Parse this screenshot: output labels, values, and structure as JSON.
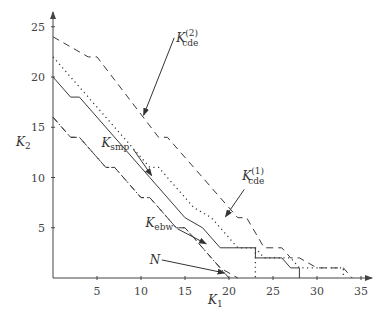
{
  "chart_data": {
    "type": "line",
    "title": "",
    "xlabel": "K1",
    "ylabel": "K2",
    "xlim": [
      0,
      36
    ],
    "ylim": [
      0,
      26
    ],
    "xticks": [
      5,
      10,
      15,
      20,
      25,
      30,
      35
    ],
    "yticks": [
      5,
      10,
      15,
      20,
      25
    ],
    "grid": false,
    "legend": "none (inline annotations with arrows)",
    "series": [
      {
        "name": "K_cde^(2)",
        "style": "dashed",
        "points": [
          [
            0,
            24
          ],
          [
            4,
            22
          ],
          [
            5,
            22
          ],
          [
            12,
            14
          ],
          [
            13,
            14
          ],
          [
            17,
            10
          ],
          [
            18,
            9
          ],
          [
            21,
            6
          ],
          [
            22,
            6
          ],
          [
            24,
            3
          ],
          [
            26,
            3
          ],
          [
            27,
            2
          ],
          [
            28,
            2
          ],
          [
            30,
            1
          ],
          [
            33,
            1
          ],
          [
            34,
            0
          ]
        ]
      },
      {
        "name": "K_cde^(1)",
        "style": "dotted",
        "points": [
          [
            0,
            22
          ],
          [
            9,
            13
          ],
          [
            11,
            11
          ],
          [
            12,
            11
          ],
          [
            16,
            7
          ],
          [
            18,
            6
          ],
          [
            20,
            4
          ],
          [
            21,
            3
          ],
          [
            23,
            3
          ],
          [
            24,
            2
          ],
          [
            27,
            2
          ],
          [
            28,
            1
          ],
          [
            33,
            1
          ],
          [
            33,
            0
          ]
        ]
      },
      {
        "name": "K_smp",
        "style": "solid",
        "points": [
          [
            0,
            20
          ],
          [
            2,
            18
          ],
          [
            3,
            18
          ],
          [
            11,
            10
          ],
          [
            15,
            6
          ],
          [
            17,
            5
          ],
          [
            19,
            3
          ],
          [
            23,
            3
          ],
          [
            23,
            2
          ],
          [
            26,
            2
          ],
          [
            27,
            1
          ],
          [
            28,
            1
          ],
          [
            28,
            0
          ]
        ]
      },
      {
        "name": "K_ebw",
        "style": "dashdot",
        "points": [
          [
            0,
            16
          ],
          [
            2,
            14
          ],
          [
            3,
            14
          ],
          [
            6,
            11
          ],
          [
            7,
            11
          ],
          [
            10,
            8
          ],
          [
            11,
            8
          ],
          [
            14,
            5
          ],
          [
            15,
            5
          ],
          [
            20,
            0
          ]
        ]
      },
      {
        "name": "N",
        "style": "dashed",
        "points": [
          [
            0,
            16
          ],
          [
            2,
            14
          ],
          [
            3,
            14
          ],
          [
            6,
            11
          ],
          [
            7,
            11
          ],
          [
            10,
            8
          ],
          [
            11,
            8
          ],
          [
            14,
            5
          ],
          [
            15,
            5
          ],
          [
            17,
            3
          ],
          [
            19,
            1
          ],
          [
            21,
            0
          ]
        ]
      }
    ],
    "annotations": [
      {
        "label": "K_cde^(2)",
        "main": "K",
        "sub": "cde",
        "sup": "(2)",
        "text_at": [
          14,
          23.5
        ],
        "arrow_to": [
          10.3,
          16.2
        ]
      },
      {
        "label": "K_cde^(1)",
        "main": "K",
        "sub": "cde",
        "sup": "(1)",
        "text_at": [
          21.5,
          9.8
        ],
        "arrow_to": [
          19.6,
          6.1
        ]
      },
      {
        "label": "K_smp",
        "main": "K",
        "sub": "smp",
        "text_at": [
          5.5,
          13
        ],
        "arrow_to": [
          11.2,
          10.2
        ]
      },
      {
        "label": "K_ebw",
        "main": "K",
        "sub": "ebw",
        "text_at": [
          10.5,
          5.1
        ],
        "arrow_to": [
          17.4,
          3.4
        ]
      },
      {
        "label": "N",
        "main": "N",
        "text_at": [
          11,
          1.4
        ],
        "arrow_to": [
          19.5,
          0.5
        ]
      }
    ]
  },
  "axes": {
    "x_label_main": "K",
    "x_label_sub": "1",
    "y_label_main": "K",
    "y_label_sub": "2"
  }
}
